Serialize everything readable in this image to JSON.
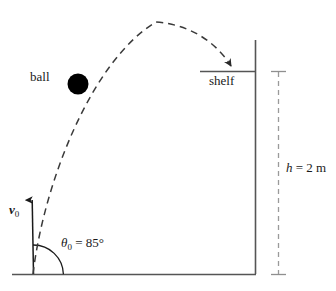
{
  "figure": {
    "labels": {
      "ball": "ball",
      "shelf": "shelf",
      "velocity_symbol": "v",
      "velocity_subscript": "0",
      "angle_symbol": "θ",
      "angle_subscript": "0",
      "angle_equals": " = ",
      "angle_value": "85°",
      "height_symbol": "h",
      "height_equals": " = ",
      "height_value": "2 m"
    },
    "values": {
      "launch_angle_deg": 85,
      "shelf_height_m": 2
    },
    "colors": {
      "ink": "#1a1a1a",
      "structure": "#555555",
      "dimension": "#9a9a9a",
      "trajectory": "#3a3a3a",
      "ball_fill": "#000000"
    }
  }
}
